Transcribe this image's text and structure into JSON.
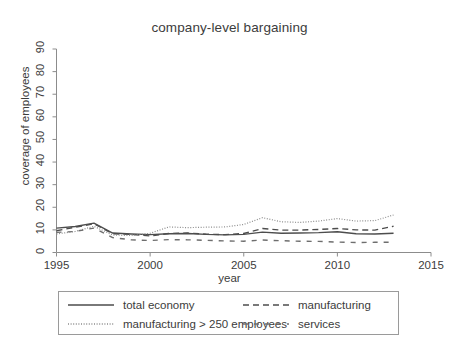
{
  "chart_data": {
    "type": "line",
    "title": "company-level bargaining",
    "xlabel": "year",
    "ylabel": "coverage of employees",
    "xlim": [
      1995,
      2015
    ],
    "ylim": [
      0,
      90
    ],
    "xticks": [
      1995,
      2000,
      2005,
      2010,
      2015
    ],
    "yticks": [
      0,
      10,
      20,
      30,
      40,
      50,
      60,
      70,
      80,
      90
    ],
    "grid": false,
    "legend_position": "below-plot",
    "x": [
      1995,
      1996,
      1997,
      1998,
      1999,
      2000,
      2001,
      2002,
      2003,
      2004,
      2005,
      2006,
      2007,
      2008,
      2009,
      2010,
      2011,
      2012,
      2013
    ],
    "series": [
      {
        "name": "total economy",
        "style": "solid",
        "color": "#4d4d4d",
        "values": [
          10.8,
          11.5,
          13.0,
          8.6,
          8.2,
          7.9,
          8.3,
          8.4,
          8.0,
          7.8,
          8.0,
          9.0,
          8.5,
          8.6,
          8.8,
          9.2,
          8.3,
          8.2,
          8.5
        ]
      },
      {
        "name": "manufacturing",
        "style": "dashed",
        "color": "#4d4d4d",
        "values": [
          9.6,
          11.2,
          12.7,
          8.3,
          8.0,
          7.3,
          8.4,
          8.6,
          8.1,
          7.9,
          8.4,
          10.6,
          9.9,
          9.9,
          10.2,
          10.6,
          10.0,
          9.9,
          11.6
        ]
      },
      {
        "name": "manufacturing > 250 employees",
        "style": "dotted",
        "color": "#8c8c8c",
        "values": [
          8.2,
          9.3,
          11.6,
          7.7,
          7.5,
          8.5,
          11.3,
          11.0,
          11.2,
          11.3,
          12.4,
          15.4,
          13.6,
          13.3,
          13.9,
          15.0,
          13.9,
          14.1,
          16.6
        ]
      },
      {
        "name": "services",
        "style": "longdash",
        "color": "#6e6e6e",
        "values": [
          8.9,
          9.3,
          10.8,
          6.6,
          5.6,
          5.3,
          5.7,
          5.6,
          5.4,
          5.1,
          5.0,
          5.5,
          5.2,
          5.0,
          4.9,
          4.6,
          4.4,
          4.5,
          4.5
        ]
      }
    ]
  },
  "legend": {
    "items": [
      {
        "label": "total economy",
        "style": "solid"
      },
      {
        "label": "manufacturing",
        "style": "dashed"
      },
      {
        "label": "manufacturing > 250 employees",
        "style": "dotted"
      },
      {
        "label": "services",
        "style": "longdash"
      }
    ]
  },
  "axes": {
    "y_labels": [
      "0",
      "10",
      "20",
      "30",
      "40",
      "50",
      "60",
      "70",
      "80",
      "90"
    ],
    "x_labels": [
      "1995",
      "2000",
      "2005",
      "2010",
      "2015"
    ]
  },
  "colors": {
    "axis": "#8c8c8c",
    "text": "#3c3c3c",
    "background": "#ffffff"
  }
}
